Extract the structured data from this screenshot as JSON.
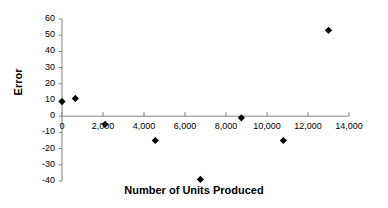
{
  "chart_data": {
    "type": "scatter",
    "title": "",
    "xlabel": "Number of Units Produced",
    "ylabel": "Error",
    "xlim": [
      0,
      14000
    ],
    "ylim": [
      -40,
      60
    ],
    "x_ticks": [
      "0",
      "2,000",
      "4,000",
      "6,000",
      "8,000",
      "10,000",
      "12,000",
      "14,000"
    ],
    "x_tick_values": [
      0,
      2000,
      4000,
      6000,
      8000,
      10000,
      12000,
      14000
    ],
    "y_ticks": [
      "60",
      "50",
      "40",
      "30",
      "20",
      "10",
      "0",
      "-10",
      "-20",
      "-30",
      "-40"
    ],
    "y_tick_values": [
      60,
      50,
      40,
      30,
      20,
      10,
      0,
      -10,
      -20,
      -30,
      -40
    ],
    "grid": false,
    "legend": null,
    "marker": "diamond",
    "marker_color": "#000000",
    "axis_color": "#808080",
    "points": [
      {
        "x": 0,
        "y": 9
      },
      {
        "x": 650,
        "y": 11
      },
      {
        "x": 2100,
        "y": -5
      },
      {
        "x": 4550,
        "y": -15
      },
      {
        "x": 6750,
        "y": -39
      },
      {
        "x": 8750,
        "y": -1
      },
      {
        "x": 10800,
        "y": -15
      },
      {
        "x": 13000,
        "y": 53
      }
    ]
  }
}
